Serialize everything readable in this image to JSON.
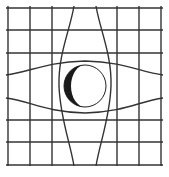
{
  "diagram": {
    "colors": {
      "background": "#ffffff",
      "grid_line": "#333333",
      "sphere_outline": "#222222",
      "crescent_fill": "#1a1a1a"
    },
    "grid": {
      "straight_vertical_x": [
        8,
        30,
        52,
        117,
        139,
        161
      ],
      "straight_horizontal_y": [
        8,
        30,
        53,
        120,
        142,
        165
      ]
    },
    "sphere": {
      "cx": 85,
      "cy": 86,
      "r": 21
    }
  }
}
